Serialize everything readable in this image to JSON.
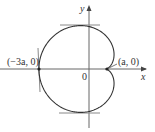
{
  "diagram": {
    "type": "cardioid",
    "labels": {
      "y_axis": "y",
      "x_axis": "x",
      "origin": "0",
      "left_point": "(−3a, 0)",
      "cusp_point": "(a, 0)"
    },
    "colors": {
      "curve": "#333333",
      "axes": "#666666",
      "tangent_lines": "#888888",
      "text": "#333333"
    },
    "geometry": {
      "origin_px": [
        89,
        69
      ],
      "a_px": 16.7,
      "tangents": [
        "horizontal-top",
        "horizontal-bottom",
        "vertical-left"
      ]
    }
  }
}
